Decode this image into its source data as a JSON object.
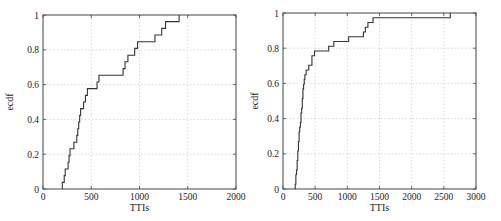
{
  "chart_data": [
    {
      "type": "line",
      "subtype": "ecdf-step",
      "title": "",
      "xlabel": "TTIs",
      "ylabel": "ecdf",
      "xlim": [
        0,
        2000
      ],
      "ylim": [
        0,
        1
      ],
      "xticks": [
        0,
        500,
        1000,
        1500,
        2000
      ],
      "yticks": [
        0,
        0.2,
        0.4,
        0.6,
        0.8,
        1
      ],
      "xtick_labels": [
        "0",
        "500",
        "1000",
        "1500",
        "2000"
      ],
      "ytick_labels": [
        "0",
        "0.2",
        "0.4",
        "0.6",
        "0.8",
        "1"
      ],
      "grid": true,
      "series": [
        {
          "name": "ecdf",
          "x": [
            200,
            220,
            230,
            260,
            270,
            280,
            320,
            350,
            360,
            370,
            380,
            390,
            420,
            440,
            460,
            560,
            580,
            830,
            850,
            880,
            950,
            980,
            1160,
            1230,
            1270,
            1410
          ],
          "y": [
            0.038,
            0.077,
            0.115,
            0.154,
            0.192,
            0.231,
            0.269,
            0.308,
            0.346,
            0.385,
            0.423,
            0.462,
            0.5,
            0.538,
            0.577,
            0.615,
            0.654,
            0.692,
            0.731,
            0.769,
            0.808,
            0.846,
            0.885,
            0.923,
            0.962,
            1.0
          ]
        }
      ]
    },
    {
      "type": "line",
      "subtype": "ecdf-step",
      "title": "",
      "xlabel": "TTIs",
      "ylabel": "ecdf",
      "xlim": [
        0,
        3000
      ],
      "ylim": [
        0,
        1
      ],
      "xticks": [
        0,
        500,
        1000,
        1500,
        2000,
        2500,
        3000
      ],
      "yticks": [
        0,
        0.2,
        0.4,
        0.6,
        0.8,
        1
      ],
      "xtick_labels": [
        "0",
        "500",
        "1000",
        "1500",
        "2000",
        "2500",
        "3000"
      ],
      "ytick_labels": [
        "0",
        "0.2",
        "0.4",
        "0.6",
        "0.8",
        "1"
      ],
      "grid": true,
      "series": [
        {
          "name": "ecdf",
          "x": [
            190,
            200,
            210,
            220,
            230,
            240,
            250,
            260,
            270,
            280,
            290,
            300,
            310,
            320,
            330,
            340,
            360,
            400,
            450,
            490,
            710,
            790,
            1020,
            1250,
            1280,
            1320,
            1400,
            2600
          ],
          "y": [
            0.027,
            0.081,
            0.108,
            0.162,
            0.216,
            0.27,
            0.324,
            0.351,
            0.378,
            0.432,
            0.459,
            0.514,
            0.568,
            0.595,
            0.622,
            0.649,
            0.676,
            0.703,
            0.757,
            0.784,
            0.811,
            0.838,
            0.865,
            0.892,
            0.919,
            0.946,
            0.973,
            1.0
          ]
        }
      ]
    }
  ]
}
